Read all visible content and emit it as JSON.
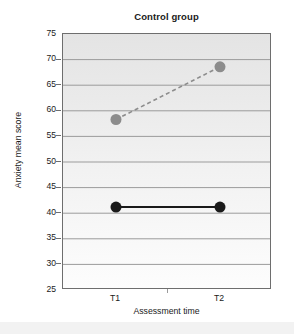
{
  "chart_data": {
    "type": "line",
    "title": "Control group",
    "xlabel": "Assessment time",
    "ylabel": "Anxiety mean score",
    "categories": [
      "T1",
      "T2"
    ],
    "x": [
      1,
      2
    ],
    "ylim": [
      25,
      75
    ],
    "ytick_labels": [
      "75",
      "70",
      "65",
      "60",
      "55",
      "50",
      "45",
      "40",
      "35",
      "30",
      "25"
    ],
    "ytick_values": [
      75,
      70,
      65,
      60,
      55,
      50,
      45,
      40,
      35,
      30,
      25
    ],
    "grid": "horizontal",
    "legend": "none",
    "plot_background": "#ededed",
    "series": [
      {
        "name": "dashed-gray-series",
        "values": [
          58.3,
          68.6
        ],
        "color": "#8c8c8c",
        "line_style": "dashed",
        "marker": "circle",
        "marker_size": 11
      },
      {
        "name": "solid-black-series",
        "values": [
          41.2,
          41.2
        ],
        "color": "#1a1a1a",
        "line_style": "solid",
        "marker": "circle",
        "marker_size": 11
      }
    ]
  },
  "axis": {
    "tick_label_t1": "T1",
    "tick_label_t2": "T2"
  }
}
